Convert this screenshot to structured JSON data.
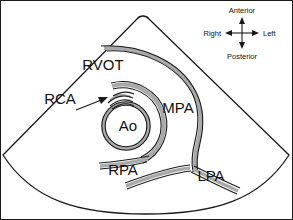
{
  "figure": {
    "type": "medical-illustration",
    "modality": "echocardiography-sector-scan",
    "view": "parasternal short axis at the level of the great vessels"
  },
  "anatomical_labels": [
    {
      "id": "rvot",
      "text": "RVOT",
      "x": 103,
      "y": 70,
      "anchor": "middle"
    },
    {
      "id": "rca",
      "text": "RCA",
      "x": 60,
      "y": 104,
      "anchor": "middle"
    },
    {
      "id": "ao",
      "text": "Ao",
      "x": 128,
      "y": 130,
      "anchor": "middle"
    },
    {
      "id": "mpa",
      "text": "MPA",
      "x": 178,
      "y": 113,
      "anchor": "middle"
    },
    {
      "id": "rpa",
      "text": "RPA",
      "x": 123,
      "y": 175,
      "anchor": "middle"
    },
    {
      "id": "lpa",
      "text": "LPA",
      "x": 211,
      "y": 180,
      "anchor": "middle"
    }
  ],
  "compass": {
    "center_x": 242,
    "center_y": 33,
    "anterior": "Anterior",
    "posterior": "Posterior",
    "right": "Right",
    "left": "Left"
  },
  "colors": {
    "background": "#ffffff",
    "outline": "#1a1a1a",
    "vessel_wall_gray": "#a9a9a9",
    "border": "#1a1a1a",
    "text": "#111111"
  }
}
